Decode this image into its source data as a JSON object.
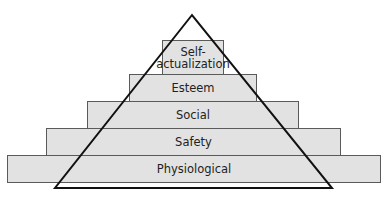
{
  "diagram": {
    "levels": [
      {
        "label_line1": "Self-",
        "label_line2": "actualization"
      },
      {
        "label": "Esteem"
      },
      {
        "label": "Social"
      },
      {
        "label": "Safety"
      },
      {
        "label": "Physiological"
      }
    ],
    "colors": {
      "fill": "#e2e2e2",
      "border": "#5a5a5a",
      "triangle": "#111111",
      "text": "#222222"
    }
  }
}
